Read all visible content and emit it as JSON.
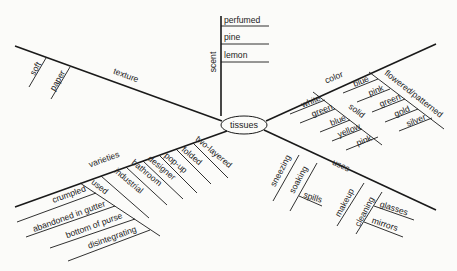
{
  "diagram": {
    "type": "mind-map",
    "center": "tissues",
    "branches": {
      "scent": {
        "label": "scent",
        "items": [
          "perfumed",
          "pine",
          "lemon"
        ]
      },
      "texture": {
        "label": "texture",
        "items": [
          "soft",
          "paper"
        ]
      },
      "color": {
        "label": "color",
        "items": [
          "white"
        ],
        "solid": {
          "label": "solid",
          "items": [
            "green",
            "blue",
            "yellow",
            "pink"
          ]
        },
        "flowered_patterned": {
          "label": "flowered/patterned",
          "items": [
            "blue",
            "pink",
            "green",
            "gold",
            "silver"
          ]
        }
      },
      "varieties": {
        "label": "varieties",
        "items": [
          "two-layered",
          "folded",
          "pop-up",
          "designer",
          "bathroom",
          "industrial"
        ],
        "used": {
          "label": "used",
          "items": [
            "crumpled",
            "abandoned in gutter",
            "bottom of purse",
            "disintegrating"
          ]
        }
      },
      "uses": {
        "label": "uses",
        "items": [
          "sneezing",
          "makeup"
        ],
        "soaking": {
          "label": "soaking",
          "items": [
            "spills"
          ]
        },
        "cleaning": {
          "label": "cleaning",
          "items": [
            "glasses",
            "mirrors"
          ]
        }
      }
    }
  }
}
